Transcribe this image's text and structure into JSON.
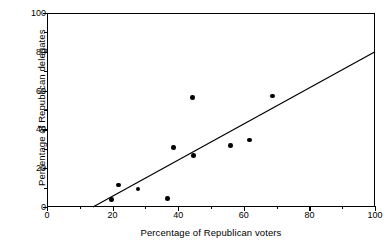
{
  "figure": {
    "background_color": "#ffffff",
    "ink_color": "#000000"
  },
  "chart_data": {
    "type": "scatter",
    "title": "",
    "subtitle": "",
    "xlabel": "Percentage of Republican voters",
    "ylabel": "Percentage of Republican delegates",
    "xlim": [
      0,
      100
    ],
    "ylim": [
      0,
      100
    ],
    "xticks": [
      0,
      20,
      40,
      60,
      80,
      100
    ],
    "yticks": [
      0,
      20,
      40,
      60,
      80,
      100
    ],
    "xtick_labels": [
      "0",
      "20",
      "40",
      "60",
      "80",
      "100"
    ],
    "ytick_labels": [
      "0",
      "20",
      "40",
      "60",
      "80",
      "100"
    ],
    "x_minor_ticks": [
      10,
      30,
      50,
      70,
      90
    ],
    "y_minor_ticks": [
      10,
      30,
      50,
      70,
      90
    ],
    "grid": false,
    "legend": false,
    "legend_position": "none",
    "marker": "filled-circle",
    "marker_color": "#000000",
    "points": [
      {
        "x": 19.7,
        "y": 4.0
      },
      {
        "x": 21.8,
        "y": 11.3
      },
      {
        "x": 27.7,
        "y": 9.3
      },
      {
        "x": 36.7,
        "y": 4.3
      },
      {
        "x": 38.6,
        "y": 30.6
      },
      {
        "x": 44.3,
        "y": 56.5
      },
      {
        "x": 44.6,
        "y": 26.4
      },
      {
        "x": 56.0,
        "y": 31.6
      },
      {
        "x": 61.8,
        "y": 34.5
      },
      {
        "x": 68.8,
        "y": 57.3
      }
    ],
    "x": [
      19.7,
      21.8,
      27.7,
      36.7,
      38.6,
      44.3,
      44.6,
      56.0,
      61.8,
      68.8
    ],
    "values": [
      4.0,
      11.3,
      9.3,
      4.3,
      30.6,
      56.5,
      26.4,
      31.6,
      34.5,
      57.3
    ],
    "trendline": {
      "type": "linear-fit",
      "color": "#000000",
      "x_start": 14.0,
      "y_start": 0.0,
      "x_end": 100.0,
      "y_end": 80.0,
      "slope": 0.93,
      "intercept": -13.0
    }
  }
}
